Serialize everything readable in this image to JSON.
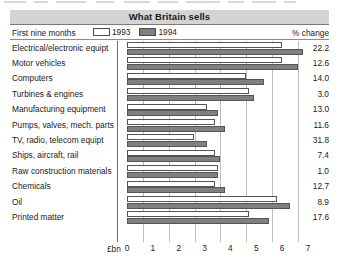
{
  "header": {
    "title": "What Britain sells"
  },
  "subheader": {
    "period_label": "First nine months",
    "pct_change_header": "% change"
  },
  "legend": {
    "position": "top",
    "entries": [
      {
        "label": "1993",
        "swatch": "white-swatch",
        "color": "#ffffff"
      },
      {
        "label": "1994",
        "swatch": "gray-swatch",
        "color": "#808080"
      }
    ]
  },
  "axis": {
    "unit_label": "£bn",
    "ticks": [
      "0",
      "1",
      "2",
      "3",
      "4",
      "5",
      "6",
      "7"
    ],
    "min": 0,
    "max": 7
  },
  "chart_data": {
    "type": "bar",
    "orientation": "horizontal",
    "title": "What Britain sells",
    "subtitle": "First nine months",
    "xlabel": "£bn",
    "ylabel": "",
    "xlim": [
      0,
      7
    ],
    "grid": true,
    "legend_position": "top",
    "categories": [
      "Electrical/electronic equipt",
      "Motor vehicles",
      "Computers",
      "Turbines & engines",
      "Manufacturing equipment",
      "Pumps, valves, mech. parts",
      "TV, radio, telecom equipt",
      "Ships, aircraft, rail",
      "Raw construction materials",
      "Chemicals",
      "Oil",
      "Printed matter"
    ],
    "series": [
      {
        "name": "1993",
        "color": "#ffffff",
        "values": [
          6.0,
          6.0,
          4.6,
          4.7,
          3.1,
          3.4,
          2.6,
          3.4,
          3.5,
          3.4,
          5.8,
          4.7
        ]
      },
      {
        "name": "1994",
        "color": "#808080",
        "values": [
          6.8,
          6.6,
          5.3,
          4.9,
          3.5,
          3.8,
          3.1,
          3.6,
          3.5,
          3.8,
          6.3,
          5.5
        ]
      }
    ],
    "annotations": {
      "label": "% change",
      "values": [
        22.2,
        12.6,
        14.0,
        3.0,
        13.0,
        11.6,
        31.8,
        7.4,
        1.0,
        12.7,
        8.9,
        17.6
      ]
    }
  },
  "rows": [
    {
      "label": "Electrical/electronic equipt",
      "v1993": 6.0,
      "v1994": 6.8,
      "pct": "22.2"
    },
    {
      "label": "Motor vehicles",
      "v1993": 6.0,
      "v1994": 6.6,
      "pct": "12.6"
    },
    {
      "label": "Computers",
      "v1993": 4.6,
      "v1994": 5.3,
      "pct": "14.0"
    },
    {
      "label": "Turbines & engines",
      "v1993": 4.7,
      "v1994": 4.9,
      "pct": "3.0"
    },
    {
      "label": "Manufacturing equipment",
      "v1993": 3.1,
      "v1994": 3.5,
      "pct": "13.0"
    },
    {
      "label": "Pumps, valves, mech. parts",
      "v1993": 3.4,
      "v1994": 3.8,
      "pct": "11.6"
    },
    {
      "label": "TV, radio, telecom equipt",
      "v1993": 2.6,
      "v1994": 3.1,
      "pct": "31.8"
    },
    {
      "label": "Ships, aircraft, rail",
      "v1993": 3.4,
      "v1994": 3.6,
      "pct": "7.4"
    },
    {
      "label": "Raw construction materials",
      "v1993": 3.5,
      "v1994": 3.5,
      "pct": "1.0"
    },
    {
      "label": "Chemicals",
      "v1993": 3.4,
      "v1994": 3.8,
      "pct": "12.7"
    },
    {
      "label": "Oil",
      "v1993": 5.8,
      "v1994": 6.3,
      "pct": "8.9"
    },
    {
      "label": "Printed matter",
      "v1993": 4.7,
      "v1994": 5.5,
      "pct": "17.6"
    }
  ]
}
